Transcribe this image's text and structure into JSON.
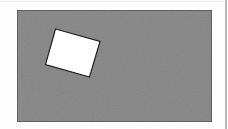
{
  "diagram": {
    "background": {
      "x": 17,
      "y": 10,
      "width": 195,
      "height": 112,
      "fill": "#858585",
      "stroke": "#3a3a3a"
    },
    "shape": {
      "kind": "rotated-square",
      "points": "55.5,29 100,41.5 89.5,77 45.5,64.5",
      "fill": "#ffffff",
      "stroke": "#222222"
    },
    "colors": {
      "divider": "#b8b8b8"
    }
  }
}
